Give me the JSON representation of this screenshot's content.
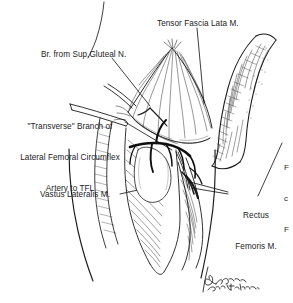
{
  "figure": {
    "kind": "surgical-anatomy-line-drawing",
    "region": "anterolateral thigh dissection",
    "background_color": "#ffffff",
    "ink_color": "#1b1b1b"
  },
  "labels": {
    "tensor_fascia_lata": "Tensor Fascia Lata M.",
    "superior_gluteal_nerve": "Br. from Sup.Gluteal N.",
    "transverse_branch_line1": "\"Transverse\" Branch of",
    "transverse_branch_line2": "Lateral Femoral Circumflex",
    "transverse_branch_line3": "Artery to TFL",
    "vastus_lateralis": "Vastus Lateralis M.",
    "rectus_femoris_line1": "Rectus",
    "rectus_femoris_line2": "Femoris M.",
    "cropped_right_edge_line1": "F",
    "cropped_right_edge_line2": "c",
    "cropped_right_edge_line3": "F"
  },
  "signature": {
    "name": "signature-mark",
    "credit_text": "after Hildebr.",
    "legible": false
  },
  "icons": {
    "signature_icon": "handwritten-signature"
  }
}
